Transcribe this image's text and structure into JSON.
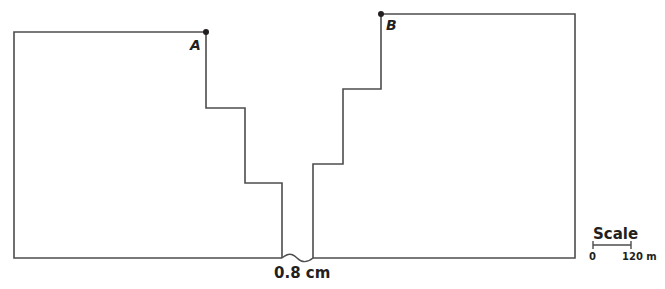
{
  "diagram": {
    "type": "cross-section of stepped canyon between two plateaus",
    "points": [
      {
        "label": "A",
        "description": "top-left edge of canyon (left plateau)"
      },
      {
        "label": "B",
        "description": "top-right edge of canyon (right plateau)"
      }
    ],
    "gap_label": "0.8 cm",
    "scale": {
      "title": "Scale",
      "start": "0",
      "end": "120 m"
    },
    "colors": {
      "line": "#4d4d4d",
      "text": "#231f20",
      "point": "#231f20"
    }
  }
}
